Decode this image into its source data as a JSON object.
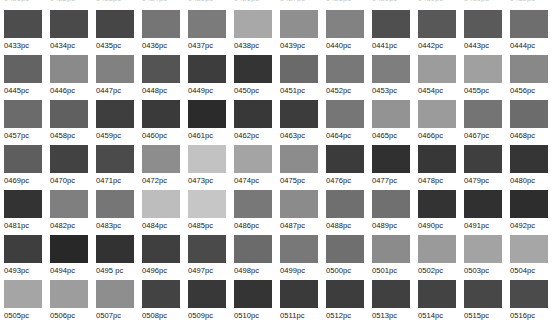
{
  "page": {
    "background_color": "#ffffff",
    "label_color": "#1a1a1a",
    "columns": 12,
    "rows": 7,
    "swatch_width_px": 38,
    "swatch_height_px": 28,
    "column_pitch_px": 46,
    "row_pitch_px": 45,
    "grid_origin_x_px": 4,
    "grid_origin_y_px": 10
  },
  "clipped_top_row": {
    "note": "partially cut-off label row at the very top edge of the screenshot",
    "labels": [
      "0421pc",
      "0422pc",
      "0423pc",
      "0424pc",
      "0425pc",
      "0426pc",
      "0427pc",
      "0428pc",
      "0429pc",
      "0430pc",
      "0431pc",
      "0432pc"
    ]
  },
  "swatches": [
    [
      {
        "label": "0433pc",
        "color": "#4d4d4d"
      },
      {
        "label": "0434pc",
        "color": "#4a4a4a"
      },
      {
        "label": "0435pc",
        "color": "#464646"
      },
      {
        "label": "0436pc",
        "color": "#757575"
      },
      {
        "label": "0437pc",
        "color": "#7b7b7b"
      },
      {
        "label": "0438pc",
        "color": "#a8a8a8"
      },
      {
        "label": "0439pc",
        "color": "#8f8f8f"
      },
      {
        "label": "0440pc",
        "color": "#828282"
      },
      {
        "label": "0441pc",
        "color": "#4f4f4f"
      },
      {
        "label": "0442pc",
        "color": "#585858"
      },
      {
        "label": "0443pc",
        "color": "#5a5a5a"
      },
      {
        "label": "0444pc",
        "color": "#6e6e6e"
      }
    ],
    [
      {
        "label": "0445pc",
        "color": "#636363"
      },
      {
        "label": "0446pc",
        "color": "#8a8a8a"
      },
      {
        "label": "0447pc",
        "color": "#818181"
      },
      {
        "label": "0448pc",
        "color": "#545454"
      },
      {
        "label": "0449pc",
        "color": "#3d3d3d"
      },
      {
        "label": "0450pc",
        "color": "#343434"
      },
      {
        "label": "0451pc",
        "color": "#6a6a6a"
      },
      {
        "label": "0452pc",
        "color": "#787878"
      },
      {
        "label": "0453pc",
        "color": "#7e7e7e"
      },
      {
        "label": "0454pc",
        "color": "#9c9c9c"
      },
      {
        "label": "0455pc",
        "color": "#a0a0a0"
      },
      {
        "label": "0456pc",
        "color": "#888888"
      }
    ],
    [
      {
        "label": "0457pc",
        "color": "#6b6b6b"
      },
      {
        "label": "0458pc",
        "color": "#606060"
      },
      {
        "label": "0459pc",
        "color": "#3e3e3e"
      },
      {
        "label": "0460pc",
        "color": "#3a3a3a"
      },
      {
        "label": "0461pc",
        "color": "#2b2b2b"
      },
      {
        "label": "0462pc",
        "color": "#383838"
      },
      {
        "label": "0463pc",
        "color": "#3c3c3c"
      },
      {
        "label": "0464pc",
        "color": "#767676"
      },
      {
        "label": "0465pc",
        "color": "#939393"
      },
      {
        "label": "0466pc",
        "color": "#9b9b9b"
      },
      {
        "label": "0467pc",
        "color": "#747474"
      },
      {
        "label": "0468pc",
        "color": "#6c6c6c"
      }
    ],
    [
      {
        "label": "0469pc",
        "color": "#5e5e5e"
      },
      {
        "label": "0470pc",
        "color": "#424242"
      },
      {
        "label": "0471pc",
        "color": "#4b4b4b"
      },
      {
        "label": "0472pc",
        "color": "#8d8d8d"
      },
      {
        "label": "0473pc",
        "color": "#c2c2c2"
      },
      {
        "label": "0474pc",
        "color": "#a4a4a4"
      },
      {
        "label": "0475pc",
        "color": "#8c8c8c"
      },
      {
        "label": "0476pc",
        "color": "#3b3b3b"
      },
      {
        "label": "0477pc",
        "color": "#303030"
      },
      {
        "label": "0478pc",
        "color": "#373737"
      },
      {
        "label": "0479pc",
        "color": "#3f3f3f"
      },
      {
        "label": "0480pc",
        "color": "#353535"
      }
    ],
    [
      {
        "label": "0481pc",
        "color": "#333333"
      },
      {
        "label": "0482pc",
        "color": "#7f7f7f"
      },
      {
        "label": "0483pc",
        "color": "#767676"
      },
      {
        "label": "0484pc",
        "color": "#bdbdbd"
      },
      {
        "label": "0485pc",
        "color": "#c6c6c6"
      },
      {
        "label": "0486pc",
        "color": "#787878"
      },
      {
        "label": "0487pc",
        "color": "#8b8b8b"
      },
      {
        "label": "0488pc",
        "color": "#6f6f6f"
      },
      {
        "label": "0489pc",
        "color": "#707070"
      },
      {
        "label": "0490pc",
        "color": "#333333"
      },
      {
        "label": "0491pc",
        "color": "#303030"
      },
      {
        "label": "0492pc",
        "color": "#2d2d2d"
      }
    ],
    [
      {
        "label": "0493pc",
        "color": "#3e3e3e"
      },
      {
        "label": "0494pc",
        "color": "#282828"
      },
      {
        "label": "0495 pc",
        "color": "#323232"
      },
      {
        "label": "0496pc",
        "color": "#3f3f3f"
      },
      {
        "label": "0497pc",
        "color": "#4a4a4a"
      },
      {
        "label": "0498pc",
        "color": "#6b6b6b"
      },
      {
        "label": "0499pc",
        "color": "#787878"
      },
      {
        "label": "0500pc",
        "color": "#6f6f6f"
      },
      {
        "label": "0501pc",
        "color": "#8b8b8b"
      },
      {
        "label": "0502pc",
        "color": "#9a9a9a"
      },
      {
        "label": "0503pc",
        "color": "#a3a3a3"
      },
      {
        "label": "0504pc",
        "color": "#a6a6a6"
      }
    ],
    [
      {
        "label": "0505pc",
        "color": "#a5a5a5"
      },
      {
        "label": "0506pc",
        "color": "#9d9d9d"
      },
      {
        "label": "0507pc",
        "color": "#8e8e8e"
      },
      {
        "label": "0508pc",
        "color": "#434343"
      },
      {
        "label": "0509pc",
        "color": "#383838"
      },
      {
        "label": "0510pc",
        "color": "#343434"
      },
      {
        "label": "0511pc",
        "color": "#3a3a3a"
      },
      {
        "label": "0512pc",
        "color": "#3d3d3d"
      },
      {
        "label": "0513pc",
        "color": "#404040"
      },
      {
        "label": "0514pc",
        "color": "#434343"
      },
      {
        "label": "0515pc",
        "color": "#474747"
      },
      {
        "label": "0516pc",
        "color": "#4b4b4b"
      }
    ]
  ]
}
